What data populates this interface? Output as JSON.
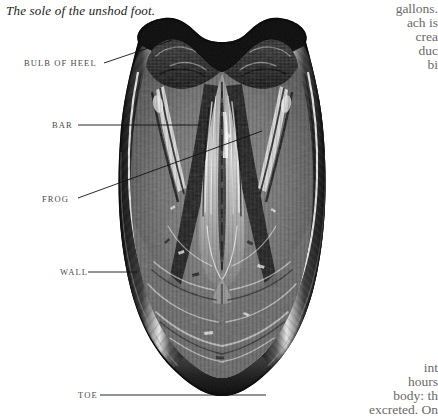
{
  "page": {
    "caption": "The sole of the unshod foot.",
    "background_color": "#ffffff",
    "illustration_name": "horse-hoof-sole-engraving",
    "illustration_colors": {
      "ink_dark": "#111111",
      "ink_mid": "#6e6e6e",
      "ink_light": "#c9c9c9",
      "highlight": "#f2f2f2"
    }
  },
  "labels": {
    "bulb_of_heel": "BULB OF HEEL",
    "bar": "BAR",
    "frog": "FROG",
    "wall": "WALL",
    "toe": "TOE"
  },
  "body_text": {
    "right_top": [
      "gallons.",
      "ach is",
      "crea",
      "duc",
      "bi"
    ],
    "right_bottom": [
      "int",
      "hours",
      "body:  th",
      "excreted. On"
    ]
  }
}
